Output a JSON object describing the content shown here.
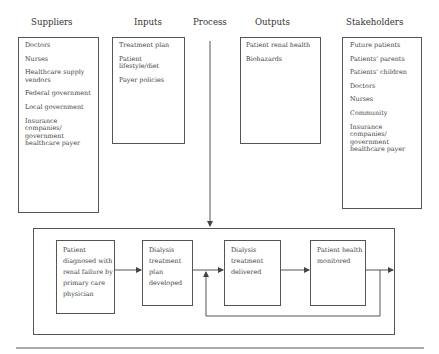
{
  "columns": {
    "suppliers": {
      "title": "Suppliers",
      "items": [
        "Doctors",
        "Nurses",
        "Healthcare supply vendors",
        "Federal government",
        "Local government",
        "Insurance companies/ government healthcare payer"
      ]
    },
    "inputs": {
      "title": "Inputs",
      "items": [
        "Treatment plan",
        "Patient lifestyle/diet",
        "Payer policies"
      ]
    },
    "process": {
      "title": "Process"
    },
    "outputs": {
      "title": "Outputs",
      "items": [
        "Patient renal health",
        "Biohazards"
      ]
    },
    "stakeholders": {
      "title": "Stakeholders",
      "items": [
        "Future patients",
        "Patients' parents",
        "Patients' children",
        "Doctors",
        "Nurses",
        "Community",
        "Insurance companies/ government healthcare payer"
      ]
    }
  },
  "process_steps": [
    {
      "label": "Patient diagnosed with renal failure by primary care physician"
    },
    {
      "label": "Dialysis treatment plan developed"
    },
    {
      "label": "Dialysis treatment delivered"
    },
    {
      "label": "Patient health monitored"
    }
  ],
  "colors": {
    "line": "#555555",
    "text": "#444444"
  }
}
